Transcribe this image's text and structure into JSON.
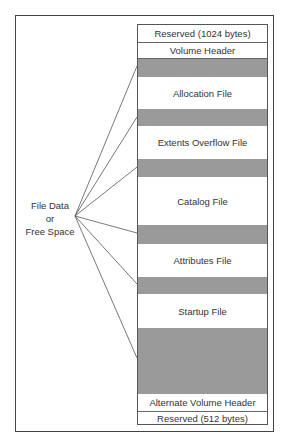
{
  "diagram": {
    "left_label": [
      "File Data",
      "or",
      "Free Space"
    ],
    "colors": {
      "free_space": "#9a9a9a",
      "structure": "#ffffff",
      "border": "#555555"
    },
    "bands": [
      {
        "label": "Reserved (1024 bytes)",
        "type": "structure"
      },
      {
        "label": "Volume Header",
        "type": "structure"
      },
      {
        "label": "",
        "type": "free_space"
      },
      {
        "label": "Allocation File",
        "type": "structure"
      },
      {
        "label": "",
        "type": "free_space"
      },
      {
        "label": "Extents Overflow File",
        "type": "structure"
      },
      {
        "label": "",
        "type": "free_space"
      },
      {
        "label": "Catalog File",
        "type": "structure"
      },
      {
        "label": "",
        "type": "free_space"
      },
      {
        "label": "Attributes File",
        "type": "structure"
      },
      {
        "label": "",
        "type": "free_space"
      },
      {
        "label": "Startup File",
        "type": "structure"
      },
      {
        "label": "",
        "type": "free_space"
      },
      {
        "label": "Alternate Volume Header",
        "type": "structure"
      },
      {
        "label": "Reserved (512 bytes)",
        "type": "structure"
      }
    ]
  }
}
